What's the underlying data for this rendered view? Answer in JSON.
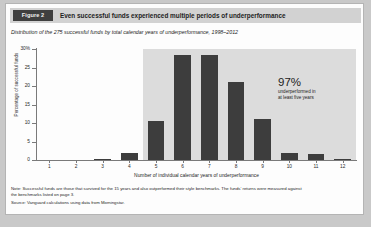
{
  "figure": {
    "tag": "Figure 2",
    "title": "Even successful funds experienced multiple periods of underperformance",
    "subtitle": "Distribution of the 275 successful funds by total calendar years of underperformance, 1998–2012"
  },
  "annotation": {
    "value": "97%",
    "caption_line1": "underperformed in",
    "caption_line2": "at least five years"
  },
  "notes": {
    "note_line1": "Note: Successful funds are those that survived for the 15 years and also outperformed their style benchmarks. The funds' returns were measured against",
    "note_line2": "the benchmarks listed on page 3.",
    "source": "Source: Vanguard calculations using data from Morningstar."
  },
  "colors": {
    "bar": "#3d3d3d",
    "highlight_band": "#dcdcdc",
    "header_band": "#d2d2d2",
    "tag_bg": "#3f3f3f",
    "axis": "#7a7a7a",
    "page_bg": "#c9c9c9",
    "figure_bg": "#fdfdfd"
  },
  "chart_data": {
    "type": "bar",
    "title": "Even successful funds experienced multiple periods of underperformance",
    "subtitle": "Distribution of the 275 successful funds by total calendar years of underperformance, 1998–2012",
    "xlabel": "Number of individual calendar years of underperformance",
    "ylabel": "Percentage of successful funds",
    "categories": [
      "1",
      "2",
      "3",
      "4",
      "5",
      "6",
      "7",
      "8",
      "9",
      "10",
      "11",
      "12"
    ],
    "values": [
      0,
      0,
      0.3,
      2.0,
      10.5,
      28.5,
      28.5,
      21.0,
      11.0,
      1.8,
      1.5,
      0.3
    ],
    "ylim": [
      0,
      30
    ],
    "yticks": [
      0,
      5,
      10,
      15,
      20,
      25,
      30
    ],
    "yticklabels": [
      "0",
      "5",
      "10",
      "15",
      "20",
      "25",
      "30%"
    ],
    "grid": false,
    "legend": false,
    "highlight_band": {
      "from_category": "5",
      "to_category": "12",
      "label": "97% underperformed in at least five years"
    }
  }
}
